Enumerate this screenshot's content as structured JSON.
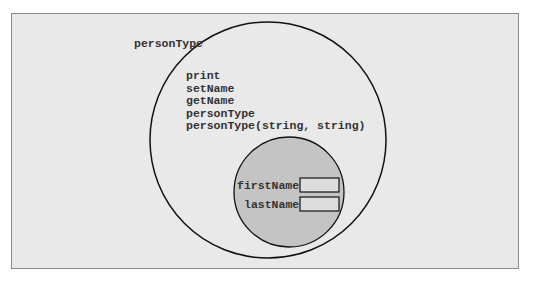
{
  "diagram": {
    "outer": {
      "label": "personType",
      "members": [
        "print",
        "setName",
        "getName",
        "personType",
        "personType(string, string)"
      ]
    },
    "inner": {
      "fields": [
        {
          "name": "firstName",
          "value": ""
        },
        {
          "name": "lastName",
          "value": ""
        }
      ]
    },
    "colors": {
      "background": "#e9e9e9",
      "inner_fill": "#c4c4c4",
      "stroke": "#111111",
      "field_box": "#dcdcdc"
    }
  }
}
